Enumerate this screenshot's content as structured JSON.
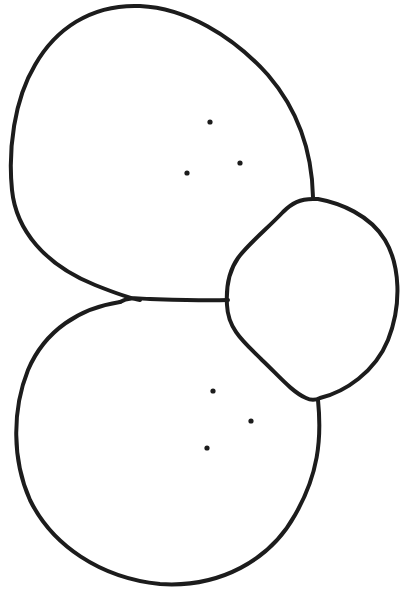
{
  "diagram": {
    "type": "line-drawing",
    "colors": {
      "background": "#ffffff",
      "stroke": "#1c1c1c"
    },
    "cells": [
      {
        "id": "upper-cell",
        "dots": [
          [
            210,
            122
          ],
          [
            240,
            163
          ],
          [
            187,
            173
          ]
        ]
      },
      {
        "id": "lower-cell",
        "dots": [
          [
            213,
            391
          ],
          [
            251,
            421
          ],
          [
            207,
            448
          ]
        ]
      },
      {
        "id": "right-cell",
        "dots": []
      }
    ]
  }
}
